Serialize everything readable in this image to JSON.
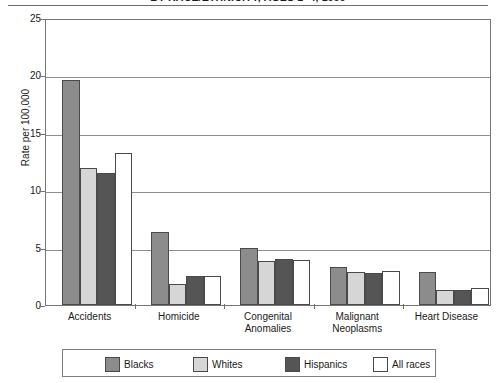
{
  "chart_data": {
    "type": "bar",
    "title": "BY RACE/ETHNICITY, AGES 1–4, 1999",
    "xlabel": "",
    "ylabel": "Rate per 100,000",
    "ylim": [
      0,
      25
    ],
    "yticks": [
      0,
      5,
      10,
      15,
      20,
      25
    ],
    "grid": true,
    "legend_position": "bottom",
    "categories": [
      "Accidents",
      "Homicide",
      "Congenital Anomalies",
      "Malignant Neoplasms",
      "Heart Disease"
    ],
    "series": [
      {
        "name": "Blacks",
        "color": "#8c8c8c",
        "values": [
          19.6,
          6.4,
          5.0,
          3.3,
          2.9
        ]
      },
      {
        "name": "Whites",
        "color": "#d6d6d6",
        "values": [
          11.9,
          1.8,
          3.8,
          2.9,
          1.3
        ]
      },
      {
        "name": "Hispanics",
        "color": "#555555",
        "values": [
          11.5,
          2.5,
          4.0,
          2.8,
          1.3
        ]
      },
      {
        "name": "All races",
        "color": "#ffffff",
        "values": [
          13.2,
          2.5,
          3.9,
          3.0,
          1.5
        ]
      }
    ]
  },
  "axis": {
    "y_title": "Rate per 100,000",
    "tick_labels": [
      "0",
      "5",
      "10",
      "15",
      "20",
      "25"
    ]
  },
  "category_labels": [
    {
      "line1": "Accidents",
      "line2": ""
    },
    {
      "line1": "Homicide",
      "line2": ""
    },
    {
      "line1": "Congenital",
      "line2": "Anomalies"
    },
    {
      "line1": "Malignant",
      "line2": "Neoplasms"
    },
    {
      "line1": "Heart Disease",
      "line2": ""
    }
  ],
  "legend": {
    "items": [
      {
        "label": "Blacks",
        "color": "#8c8c8c"
      },
      {
        "label": "Whites",
        "color": "#d6d6d6"
      },
      {
        "label": "Hispanics",
        "color": "#555555"
      },
      {
        "label": "All races",
        "color": "#ffffff"
      }
    ]
  }
}
